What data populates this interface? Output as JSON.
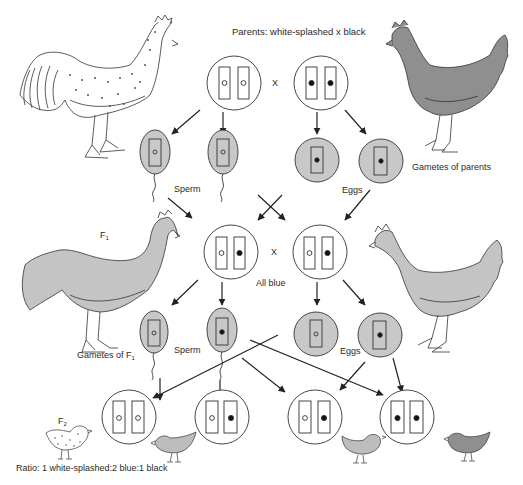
{
  "title": "Parents: white-splashed x black",
  "cross_symbol": "X",
  "labels": {
    "sperm_parents": "Sperm",
    "eggs_parents": "Eggs",
    "gametes_parents": "Gametes of parents",
    "f1": "F",
    "f1_sub": "1",
    "all_blue": "All blue",
    "gametes_f1": "Gametes of F",
    "gametes_f1_sub": "1",
    "sperm_f1": "Sperm",
    "eggs_f1": "Eggs",
    "f2": "F",
    "f2_sub": "2",
    "ratio": "Ratio: 1 white-splashed:2 blue:1 black"
  },
  "genotypes": {
    "parent_male": [
      "white",
      "white"
    ],
    "parent_female": [
      "black",
      "black"
    ],
    "f1_male": [
      "white",
      "black"
    ],
    "f1_female": [
      "white",
      "black"
    ],
    "f2": [
      [
        "white",
        "white"
      ],
      [
        "white",
        "black"
      ],
      [
        "white",
        "black"
      ],
      [
        "black",
        "black"
      ]
    ]
  },
  "colors": {
    "gamete_fill": "#c8c8c8",
    "blue_bird": "#bdbdbd",
    "black_bird": "#8f8f8f",
    "line": "#222222"
  }
}
